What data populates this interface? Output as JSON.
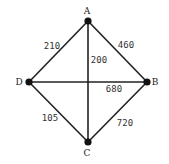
{
  "graph": {
    "nodes": [
      {
        "id": "A",
        "x": 88,
        "y": 21,
        "lx": 87,
        "ly": 14
      },
      {
        "id": "B",
        "x": 147,
        "y": 82,
        "lx": 155,
        "ly": 85
      },
      {
        "id": "C",
        "x": 88,
        "y": 142,
        "lx": 87,
        "ly": 156
      },
      {
        "id": "D",
        "x": 29,
        "y": 82,
        "lx": 19,
        "ly": 85
      }
    ],
    "edges": [
      {
        "from": "A",
        "to": "D",
        "weight": "210",
        "lx": 52,
        "ly": 49
      },
      {
        "from": "A",
        "to": "B",
        "weight": "460",
        "lx": 126,
        "ly": 48
      },
      {
        "from": "A",
        "to": "C",
        "weight": "200",
        "lx": 99,
        "ly": 63
      },
      {
        "from": "D",
        "to": "B",
        "weight": "680",
        "lx": 114,
        "ly": 92
      },
      {
        "from": "D",
        "to": "C",
        "weight": "105",
        "lx": 50,
        "ly": 121
      },
      {
        "from": "B",
        "to": "C",
        "weight": "720",
        "lx": 125,
        "ly": 126
      }
    ],
    "colors": {
      "edge": "#222222",
      "node": "#111111"
    }
  }
}
